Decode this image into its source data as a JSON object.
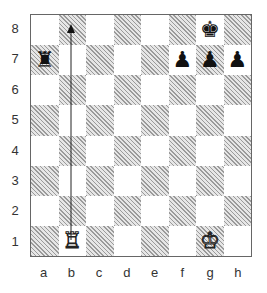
{
  "board": {
    "ranks": [
      "8",
      "7",
      "6",
      "5",
      "4",
      "3",
      "2",
      "1"
    ],
    "files": [
      "a",
      "b",
      "c",
      "d",
      "e",
      "f",
      "g",
      "h"
    ],
    "pieces": [
      {
        "square": "g8",
        "piece": "king",
        "color": "black",
        "glyph": "♚"
      },
      {
        "square": "a7",
        "piece": "rook",
        "color": "black",
        "glyph": "♜"
      },
      {
        "square": "f7",
        "piece": "pawn",
        "color": "black",
        "glyph": "♟"
      },
      {
        "square": "g7",
        "piece": "pawn",
        "color": "black",
        "glyph": "♟"
      },
      {
        "square": "h7",
        "piece": "pawn",
        "color": "black",
        "glyph": "♟"
      },
      {
        "square": "b1",
        "piece": "rook",
        "color": "white",
        "glyph": "♖"
      },
      {
        "square": "g1",
        "piece": "king",
        "color": "white",
        "glyph": "♔"
      }
    ],
    "arrow": {
      "from": "b1",
      "to": "b8"
    }
  }
}
